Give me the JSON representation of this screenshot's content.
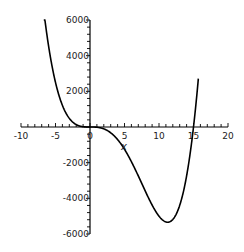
{
  "chart_data": {
    "type": "line",
    "title": "",
    "xlabel": "x",
    "ylabel": "",
    "xlim": [
      -10,
      20
    ],
    "ylim": [
      -6000,
      6000
    ],
    "grid": false,
    "legend": null,
    "x_ticks": [
      -10,
      -5,
      0,
      5,
      10,
      15,
      20
    ],
    "x_tick_labels": [
      "-10",
      "-5",
      "0",
      "5",
      "10",
      "15",
      "20"
    ],
    "y_ticks": [
      -6000,
      -4000,
      -2000,
      2000,
      4000,
      6000
    ],
    "y_tick_labels": [
      "-6000",
      "-4000",
      "-2000",
      "2000",
      "4000",
      "6000"
    ],
    "series": [
      {
        "name": "y = x^3 (x - 15)",
        "color": "#000000",
        "x": [
          -6.7,
          -6,
          -5,
          -4,
          -3,
          -2,
          -1,
          0,
          1,
          2,
          3,
          4,
          5,
          6,
          7,
          8,
          9,
          10,
          11,
          11.25,
          12,
          13,
          14,
          15,
          15.7
        ],
        "y": [
          6527,
          4536,
          2500,
          1216,
          486,
          136,
          16,
          0,
          -14,
          -104,
          -324,
          -704,
          -1250,
          -1944,
          -2744,
          -3584,
          -4374,
          -5000,
          -5324,
          -5339,
          -5184,
          -4394,
          -2744,
          0,
          2720
        ]
      }
    ],
    "annotations": []
  }
}
